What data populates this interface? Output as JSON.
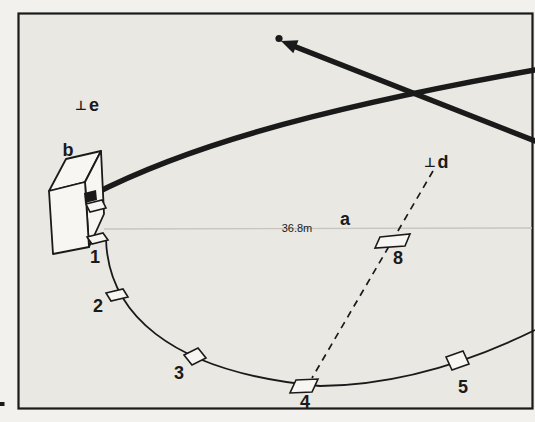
{
  "figure": {
    "labels": {
      "hut": "b",
      "point_e_symbol": "⊥",
      "point_e": "e",
      "point_d_symbol": "⊥",
      "point_d": "d",
      "distance_line": "a",
      "distance_value": "36.8m"
    },
    "stations": [
      {
        "id": "1"
      },
      {
        "id": "2"
      },
      {
        "id": "3"
      },
      {
        "id": "4"
      },
      {
        "id": "5"
      },
      {
        "id": "8"
      }
    ],
    "colors": {
      "paper": "#f2f1ed",
      "panel": "#e9e8e3",
      "ink": "#1a1a1a",
      "faint": "#c6c5c0"
    }
  }
}
